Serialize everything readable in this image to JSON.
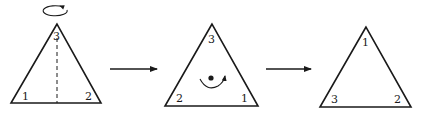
{
  "diagram": {
    "stages": [
      {
        "id": "initial",
        "vertices": {
          "top": "3",
          "bottom_left": "1",
          "bottom_right": "2"
        },
        "operation_icon": "flip-about-vertical-axis",
        "axis": "dashed vertical line through top vertex"
      },
      {
        "id": "after-flip",
        "vertices": {
          "top": "3",
          "bottom_left": "2",
          "bottom_right": "1"
        },
        "operation_icon": "rotation-about-center"
      },
      {
        "id": "after-rotation",
        "vertices": {
          "top": "1",
          "bottom_left": "3",
          "bottom_right": "2"
        }
      }
    ],
    "arrows": [
      {
        "from": "initial",
        "to": "after-flip"
      },
      {
        "from": "after-flip",
        "to": "after-rotation"
      }
    ],
    "colors": {
      "ink": "#1a1a1a",
      "background": "#ffffff"
    }
  }
}
